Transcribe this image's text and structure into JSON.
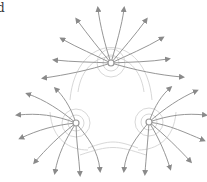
{
  "panel_label": "d",
  "diagram": {
    "type": "field-lines",
    "charges": [
      {
        "id": "top",
        "x": 111,
        "y": 63
      },
      {
        "id": "left",
        "x": 76,
        "y": 123
      },
      {
        "id": "right",
        "x": 149,
        "y": 122
      }
    ],
    "colors": {
      "field_line": "#8a8a8a",
      "equipotential": "#d6d6d6",
      "charge": "#999999"
    }
  }
}
